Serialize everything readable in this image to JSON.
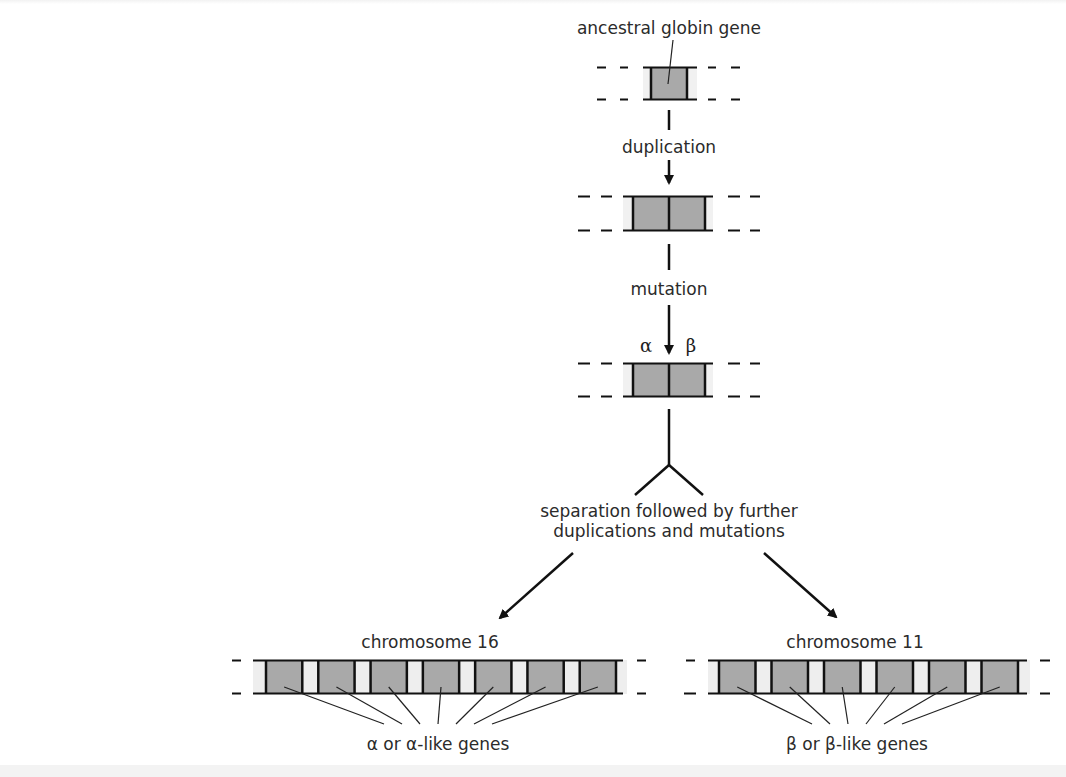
{
  "colors": {
    "gene_fill": "#a9a9a9",
    "spacer_fill": "#eeeeee",
    "line": "#111111",
    "text": "#2b2b2b"
  },
  "labels": {
    "ancestral": "ancestral globin gene",
    "duplication": "duplication",
    "mutation": "mutation",
    "alpha_symbol": "α",
    "beta_symbol": "β",
    "separation_line1": "separation followed by further",
    "separation_line2": "duplications and mutations",
    "chromosome16": "chromosome 16",
    "chromosome11": "chromosome 11",
    "alpha_genes": "α or α-like genes",
    "beta_genes": "β or β-like genes"
  },
  "stages": [
    {
      "name": "ancestral",
      "genes": 1
    },
    {
      "name": "duplicated",
      "genes": 2
    },
    {
      "name": "mutated",
      "genes": 2,
      "gene_labels": [
        "α",
        "β"
      ]
    }
  ],
  "chromosomes": [
    {
      "name": "chromosome 16",
      "gene_count": 7,
      "gene_type": "α or α-like"
    },
    {
      "name": "chromosome 11",
      "gene_count": 6,
      "gene_type": "β or β-like"
    }
  ]
}
